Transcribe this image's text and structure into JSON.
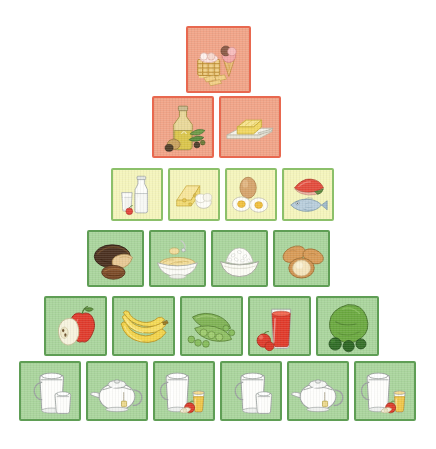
{
  "figure": {
    "title": "Food Pyramid",
    "background_color": "#ffffff",
    "width": 436,
    "height": 449
  },
  "palette": {
    "sweets_fill": "#f0a387",
    "sweets_border": "#e8684f",
    "protein_fill": "#f4f4bb",
    "protein_border": "#8cc06a",
    "plant_fill": "#a9d49c",
    "plant_border": "#5f9e55"
  },
  "tiers": [
    {
      "name": "sweets",
      "label": "Sweets and pastries",
      "fill": "#f0a387",
      "border": "#e8684f",
      "top": 26,
      "left": 186,
      "tile_width": 65,
      "tile_height": 67,
      "gap": 5,
      "tiles": [
        {
          "name": "sweets-cakes-icecream",
          "label": "Cakes, pastries and ice cream",
          "icon": "icecream-cake-icon"
        }
      ]
    },
    {
      "name": "fats",
      "label": "Fats and oils",
      "fill": "#f0a387",
      "border": "#e8684f",
      "top": 96,
      "left": 152,
      "tile_width": 62,
      "tile_height": 62,
      "gap": 5,
      "tiles": [
        {
          "name": "fats-olive-oil",
          "label": "Olive oil with olives",
          "icon": "olive-oil-icon"
        },
        {
          "name": "fats-butter",
          "label": "Butter on a dish",
          "icon": "butter-icon"
        }
      ]
    },
    {
      "name": "protein",
      "label": "Milk, cheese, eggs and fish",
      "fill": "#f4f4bb",
      "border": "#8cc06a",
      "top": 168,
      "left": 111,
      "tile_width": 52,
      "tile_height": 53,
      "gap": 5,
      "tiles": [
        {
          "name": "protein-milk",
          "label": "Milk bottle and glass of milk",
          "icon": "milk-bottle-icon"
        },
        {
          "name": "protein-cheese",
          "label": "Cheese wedge and eggs",
          "icon": "cheese-icon"
        },
        {
          "name": "protein-eggs",
          "label": "Boiled and whole eggs",
          "icon": "eggs-icon"
        },
        {
          "name": "protein-fish",
          "label": "Fish and seafood",
          "icon": "fish-icon"
        }
      ]
    },
    {
      "name": "grains",
      "label": "Bread, pasta, rice and potatoes",
      "fill": "#a9d49c",
      "border": "#5f9e55",
      "top": 230,
      "left": 87,
      "tile_width": 57,
      "tile_height": 57,
      "gap": 5,
      "tiles": [
        {
          "name": "grains-bread",
          "label": "Dark bread loaf and rolls",
          "icon": "bread-icon"
        },
        {
          "name": "grains-pasta",
          "label": "Bowl of pasta with fork",
          "icon": "pasta-bowl-icon"
        },
        {
          "name": "grains-rice",
          "label": "Bowl of rice",
          "icon": "rice-bowl-icon"
        },
        {
          "name": "grains-potatoes",
          "label": "Potatoes",
          "icon": "potato-icon"
        }
      ]
    },
    {
      "name": "produce",
      "label": "Fruit and vegetables",
      "fill": "#a9d49c",
      "border": "#5f9e55",
      "top": 296,
      "left": 44,
      "tile_width": 63,
      "tile_height": 60,
      "gap": 5,
      "tiles": [
        {
          "name": "produce-apples",
          "label": "Whole and halved apples",
          "icon": "apple-icon"
        },
        {
          "name": "produce-bananas",
          "label": "Bunch of bananas",
          "icon": "banana-icon"
        },
        {
          "name": "produce-peas",
          "label": "Pea pods and green peas",
          "icon": "peas-icon"
        },
        {
          "name": "produce-tomato-juice",
          "label": "Glass of tomato juice with tomatoes",
          "icon": "tomato-juice-icon"
        },
        {
          "name": "produce-greens",
          "label": "Lettuce and broccoli",
          "icon": "lettuce-broccoli-icon"
        }
      ]
    },
    {
      "name": "fluids",
      "label": "Water and unsweetened drinks",
      "fill": "#a9d49c",
      "border": "#5f9e55",
      "top": 361,
      "left": 19,
      "tile_width": 62,
      "tile_height": 60,
      "gap": 5,
      "tiles": [
        {
          "name": "fluids-water-jug-1",
          "label": "Water jug and mug",
          "icon": "water-jug-icon"
        },
        {
          "name": "fluids-teapot-1",
          "label": "Teapot with tea bag",
          "icon": "teapot-icon"
        },
        {
          "name": "fluids-water-juice-1",
          "label": "Water jug with apple and juice glass",
          "icon": "jug-juice-icon"
        },
        {
          "name": "fluids-water-jug-2",
          "label": "Water jug and mug",
          "icon": "water-jug-icon"
        },
        {
          "name": "fluids-teapot-2",
          "label": "Teapot with tea bag",
          "icon": "teapot-icon"
        },
        {
          "name": "fluids-water-juice-2",
          "label": "Water jug with apple and juice glass",
          "icon": "jug-juice-icon"
        }
      ]
    }
  ]
}
